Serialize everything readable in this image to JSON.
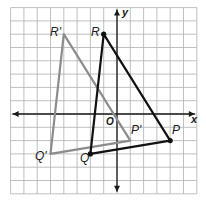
{
  "figure": {
    "grid": {
      "x_min": -8,
      "x_max": 6,
      "y_min": -6,
      "y_max": 8,
      "origin_px": [
        117,
        114
      ],
      "cell_px": 13.3,
      "line_color": "#b0b0b0"
    },
    "axes": {
      "x_label": "x",
      "y_label": "y",
      "origin_label": "O",
      "color": "#1a1a1a"
    },
    "triangles": [
      {
        "name": "PQR",
        "color": "#111111",
        "vertices": [
          {
            "label": "P",
            "x": 4,
            "y": -2
          },
          {
            "label": "Q",
            "x": -2,
            "y": -3
          },
          {
            "label": "R",
            "x": -1,
            "y": 6
          }
        ]
      },
      {
        "name": "P'Q'R'",
        "color": "#8c8c8c",
        "vertices": [
          {
            "label": "P'",
            "x": 1,
            "y": -2
          },
          {
            "label": "Q'",
            "x": -5,
            "y": -3
          },
          {
            "label": "R'",
            "x": -4,
            "y": 6
          }
        ]
      }
    ]
  }
}
